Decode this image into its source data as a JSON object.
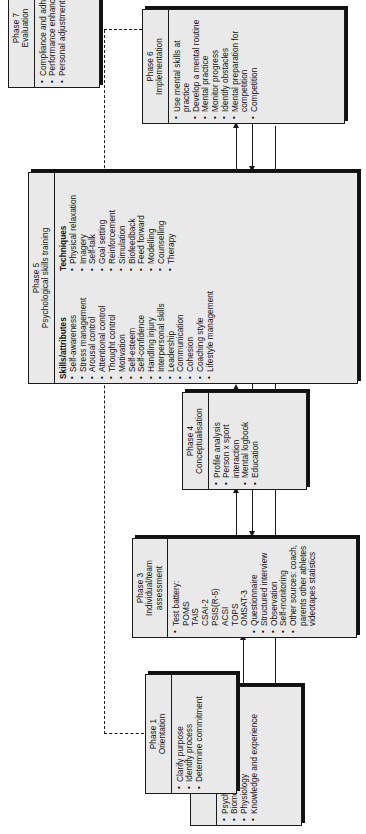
{
  "diagram": {
    "phases": [
      {
        "id": "phase1",
        "phase_label": "Phase 1",
        "name": "Orientation",
        "items": [
          "Clarify purpose",
          "Identify process",
          "Determine commitment"
        ]
      },
      {
        "id": "phase2",
        "phase_label": "Phase 2",
        "name": "Sport analysis",
        "items": [
          "Psychology",
          "Biomechanics",
          "Physiology",
          "Knowledge and experience"
        ]
      },
      {
        "id": "phase3",
        "phase_label": "Phase 3",
        "name": "Individual/team assessment",
        "items": [
          "Test battery:",
          "POMS",
          "TAIS",
          "CSAI-2",
          "PSIS(R-5)",
          "ACSI",
          "TOPS",
          "OMSAT-3",
          "Questionnaire",
          "Structured interview",
          "Observation",
          "Self-monitoring",
          "Other sources: coach, parents other athletes videotapes statistics"
        ],
        "bulleted_flags": [
          true,
          false,
          false,
          false,
          false,
          false,
          false,
          false,
          true,
          true,
          true,
          true,
          true
        ]
      },
      {
        "id": "phase4",
        "phase_label": "Phase 4",
        "name": "Conceptualisation",
        "items": [
          "Profile analysis",
          "Person x sport interaction",
          "Mental logbook",
          "Education"
        ]
      },
      {
        "id": "phase5",
        "phase_label": "Phase 5",
        "name": "Psychological skills training",
        "columns": [
          {
            "heading": "Skills/attributes",
            "items": [
              "Self-awareness",
              "Stress management",
              "Arousal control",
              "Attentional control",
              "Thought control",
              "Motivation",
              "Self-esteem",
              "Self-confidence",
              "Handling injury",
              "Interpersonal skills",
              "Leadership",
              "Communication",
              "Cohesion",
              "Coaching style",
              "Lifestyle management"
            ]
          },
          {
            "heading": "Techniques",
            "items": [
              "Physical relaxation",
              "Imagery",
              "Self-talk",
              "Goal setting",
              "Reinforcement",
              "Simulation",
              "Biofeedback",
              "Feed forward",
              "Modelling",
              "Counselling",
              "Therapy"
            ]
          }
        ]
      },
      {
        "id": "phase6",
        "phase_label": "Phase 6",
        "name": "Implementation",
        "items": [
          "Use mental skills at practice",
          "Develop a mental routine",
          "Mental practice",
          "Monitor progress",
          "Identify obstacles",
          "Mental preparation for competition",
          "Competition"
        ]
      },
      {
        "id": "phase7",
        "phase_label": "Phase 7",
        "name": "Evaluation",
        "items": [
          "Compliance and adherence",
          "Performance enhancement",
          "Personal adjustment"
        ]
      }
    ],
    "colors": {
      "box_fill": "#e9e9e9",
      "line": "#1a1a1a",
      "shadow": "#111111",
      "page": "#ffffff"
    }
  }
}
